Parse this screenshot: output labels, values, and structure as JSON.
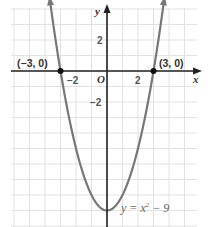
{
  "chart_data": {
    "type": "line",
    "title": "",
    "xlabel": "x",
    "ylabel": "y",
    "origin_label": "O",
    "xlim": [
      -6,
      6
    ],
    "ylim": [
      -10,
      4.5
    ],
    "grid": true,
    "x_ticks": [
      {
        "value": -2,
        "label": "−2"
      },
      {
        "value": 2,
        "label": "2"
      }
    ],
    "y_ticks": [
      {
        "value": 2,
        "label": "2"
      },
      {
        "value": -2,
        "label": "−2"
      }
    ],
    "series": [
      {
        "name": "y = x^2 - 9",
        "function": "x^2 - 9",
        "x_range": [
          -3.7,
          3.7
        ],
        "color": "#777777"
      }
    ],
    "points": [
      {
        "x": -3,
        "y": 0,
        "label": "(−3, 0)"
      },
      {
        "x": 3,
        "y": 0,
        "label": "(3, 0)"
      }
    ],
    "annotation": {
      "text": "y = x² − 9",
      "parts": {
        "lhs": "y = x",
        "sup": "2",
        "rhs": " − 9"
      }
    },
    "colors": {
      "grid": "#e2e2e2",
      "axis": "#222222",
      "curve": "#777777",
      "point": "#111111"
    }
  }
}
